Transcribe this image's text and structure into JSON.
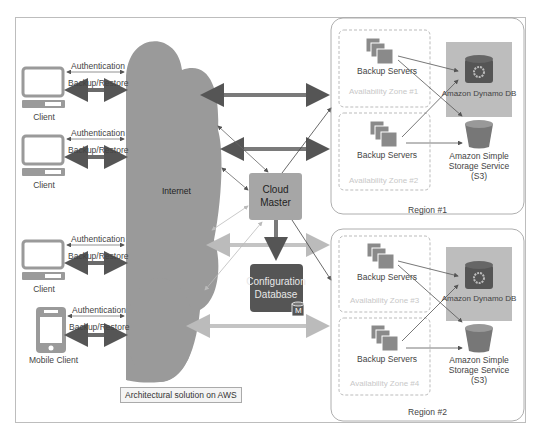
{
  "diagram": {
    "caption": "Architectural solution on AWS",
    "internet_label": "Internet",
    "clients": [
      {
        "label": "Client",
        "type": "desktop",
        "auth_label": "Authentication",
        "backup_label": "Backup/Restore"
      },
      {
        "label": "Client",
        "type": "desktop",
        "auth_label": "Authentication",
        "backup_label": "Backup/Restore"
      },
      {
        "label": "Client",
        "type": "desktop",
        "auth_label": "Authentication",
        "backup_label": "Backup/Restore"
      },
      {
        "label": "Mobile Client",
        "type": "mobile",
        "auth_label": "Authentication",
        "backup_label": "Backup/Restore"
      }
    ],
    "cloud_master": {
      "line1": "Cloud",
      "line2": "Master"
    },
    "config_db": {
      "line1": "Configuration",
      "line2": "Database",
      "badge": "M"
    },
    "regions": [
      {
        "label": "Region #1",
        "zones": [
          {
            "label": "Availability Zone #1",
            "servers_label": "Backup Servers"
          },
          {
            "label": "Availability Zone #2",
            "servers_label": "Backup Servers"
          }
        ],
        "dynamo_label": "Amazon Dynamo DB",
        "s3_label_1": "Amazon Simple",
        "s3_label_2": "Storage Service",
        "s3_label_3": "(S3)"
      },
      {
        "label": "Region #2",
        "zones": [
          {
            "label": "Availability Zone #3",
            "servers_label": "Backup Servers"
          },
          {
            "label": "Availability Zone #4",
            "servers_label": "Backup Servers"
          }
        ],
        "dynamo_label": "Amazon Dynamo DB",
        "s3_label_1": "Amazon Simple",
        "s3_label_2": "Storage Service",
        "s3_label_3": "(S3)"
      }
    ],
    "colors": {
      "cloud": "#9a9a9a",
      "cloud_master": "#a6a6a6",
      "config_db": "#555555",
      "dynamo_bg": "#bdbdbd",
      "device": "#9a9a9a",
      "thick_arrow": "#7a7a7a",
      "light_arrow": "#c4c4c4"
    }
  }
}
